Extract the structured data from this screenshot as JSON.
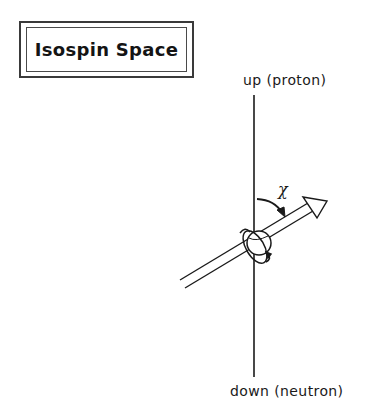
{
  "title": "Isospin Space",
  "axis": {
    "top_label": "up (proton)",
    "bottom_label": "down (neutron)"
  },
  "angle_label": "χ",
  "icons": {
    "spin_vector": "arrow-icon",
    "particle": "sphere-icon",
    "rotation": "rotation-arrow-icon",
    "angle": "curved-arrow-icon"
  },
  "colors": {
    "ink": "#1a1a1a",
    "background": "#ffffff"
  }
}
